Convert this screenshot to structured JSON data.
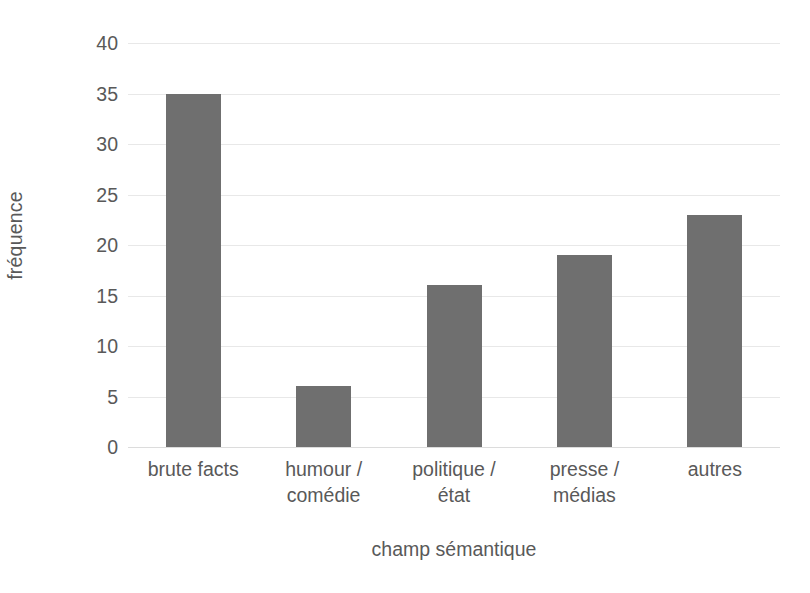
{
  "chart_data": {
    "type": "bar",
    "title": "",
    "subtitle": "",
    "xlabel": "champ sémantique",
    "ylabel": "fréquence",
    "categories": [
      "brute facts",
      "humour / comédie",
      "politique / état",
      "presse / médias",
      "autres"
    ],
    "category_lines": [
      [
        "brute facts",
        ""
      ],
      [
        "humour /",
        "comédie"
      ],
      [
        "politique /",
        "état"
      ],
      [
        "presse /",
        "médias"
      ],
      [
        "autres",
        ""
      ]
    ],
    "values": [
      35,
      6,
      16,
      19,
      23
    ],
    "ylim": [
      0,
      40
    ],
    "ytick_values": [
      0,
      5,
      10,
      15,
      20,
      25,
      30,
      35,
      40
    ],
    "ytick_labels": [
      "0",
      "5",
      "10",
      "15",
      "20",
      "25",
      "30",
      "35",
      "40"
    ],
    "ytick_step": 5,
    "grid": true,
    "grid_axis": "y",
    "legend": false,
    "legend_position": "none",
    "bar_color": "#6F6F6F",
    "grid_color": "#E8E8E8",
    "text_color": "#595959",
    "background_color": "#FFFFFF"
  }
}
